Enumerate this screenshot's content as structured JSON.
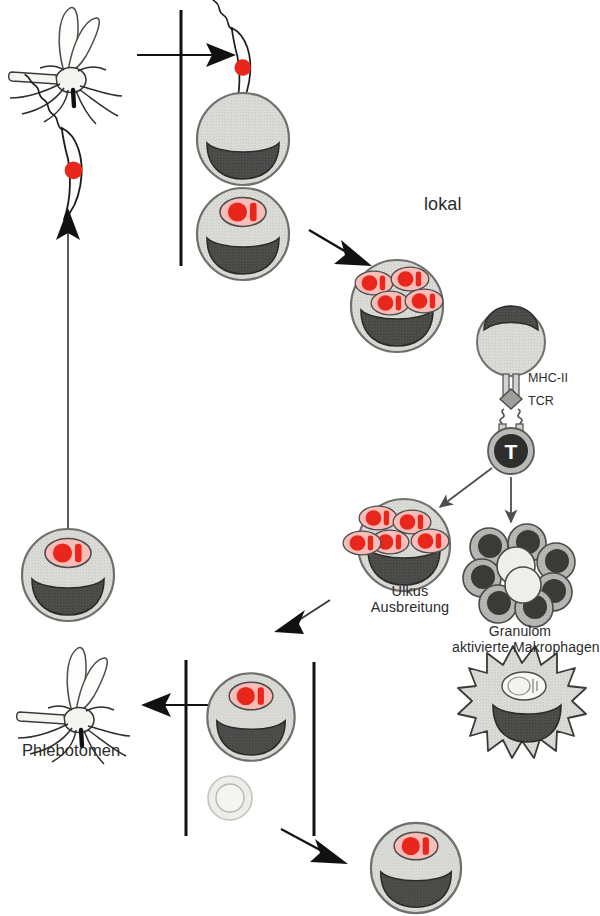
{
  "figure": {
    "background_color": "#ffffff",
    "labels": {
      "lokal": "lokal",
      "mhc_ii": "MHC-II",
      "tcr": "TCR",
      "ulkus_line1": "Ulkus",
      "ulkus_line2": "Ausbreitung",
      "granulom_line1": "Granulom",
      "granulom_line2": "aktivierte Makrophagen",
      "phlebotomen": "Phlebotomen",
      "t_cell_letter": "T"
    },
    "colors": {
      "cell_body": "#d9d9d5",
      "cell_body_edge": "#7a7a76",
      "nucleus": "#4b4b49",
      "parasite_red": "#e8261c",
      "parasite_halo": "#f7b9b4",
      "outline": "#1d1d1d",
      "text": "#2b2b2b",
      "granulom_cell": "#b4b4b0",
      "granulom_nucleus": "#3a3a38",
      "arrow_thin": "#5a5a58"
    },
    "elements": [
      {
        "name": "sandfly-top",
        "type": "insect",
        "desc": "Phlebotomus sandfly, top left"
      },
      {
        "name": "promastigote-free",
        "type": "parasite",
        "desc": "free promastigote with flagellum, left"
      },
      {
        "name": "promastigote-entering",
        "type": "parasite",
        "desc": "promastigote entering macrophage, top"
      },
      {
        "name": "macrophage-1",
        "type": "cell",
        "amastigotes": 0
      },
      {
        "name": "macrophage-2",
        "type": "cell",
        "amastigotes": 1
      },
      {
        "name": "macrophage-3",
        "type": "cell",
        "amastigotes": 4
      },
      {
        "name": "antigen-presenting-cell",
        "type": "cell",
        "amastigotes": 0
      },
      {
        "name": "t-cell",
        "type": "cell",
        "desc": "T lymphocyte"
      },
      {
        "name": "mhc-tcr-synapse",
        "type": "receptor-complex"
      },
      {
        "name": "macrophage-ulkus",
        "type": "cell",
        "amastigotes": 4
      },
      {
        "name": "granuloma-cluster",
        "type": "cell-cluster",
        "cell_count": 9
      },
      {
        "name": "activated-macrophage",
        "type": "cell",
        "desc": "spiky activated macrophage"
      },
      {
        "name": "macrophage-4",
        "type": "cell",
        "amastigotes": 1
      },
      {
        "name": "macrophage-5",
        "type": "cell",
        "amastigotes": 1
      },
      {
        "name": "small-vesicle",
        "type": "vesicle"
      },
      {
        "name": "sandfly-bottom",
        "type": "insect",
        "desc": "Phlebotomus sandfly, bottom left"
      }
    ],
    "arrows": [
      {
        "name": "arrow-into-skin-top",
        "direction": "right"
      },
      {
        "name": "arrow-to-multi-infected",
        "direction": "down-right"
      },
      {
        "name": "arrow-t-to-ulkus",
        "direction": "down-left"
      },
      {
        "name": "arrow-t-to-granulom",
        "direction": "down"
      },
      {
        "name": "arrow-ulkus-to-bottom",
        "direction": "down-left"
      },
      {
        "name": "arrow-to-sandfly",
        "direction": "left"
      },
      {
        "name": "arrow-bottom-right",
        "direction": "down-right"
      },
      {
        "name": "arrow-cycle-up",
        "direction": "up"
      }
    ],
    "dividers": [
      {
        "name": "skin-barrier-top"
      },
      {
        "name": "skin-barrier-bottom-left"
      },
      {
        "name": "skin-barrier-bottom-right"
      }
    ]
  }
}
